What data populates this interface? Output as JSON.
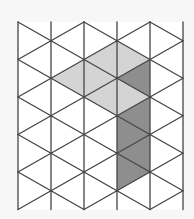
{
  "diagram": {
    "type": "triangular-isometric-grid",
    "columns_x": [
      18,
      51,
      84,
      117,
      150,
      183
    ],
    "even_col_nodes_y": [
      22,
      59.5,
      97,
      134.5,
      172,
      209.5
    ],
    "odd_col_nodes_y": [
      40.75,
      78.25,
      115.75,
      153.25,
      190.75
    ],
    "top_y": 22,
    "bottom_y": 209.5,
    "colors": {
      "background": "#f7f7f7",
      "line": "#454545",
      "light_fill": "#d4d4d4",
      "dark_fill": "#8e8e8e",
      "empty_fill": "#ffffff"
    },
    "shaded_triangles": [
      {
        "shade": "light",
        "points": [
          [
            84,
            59.5
          ],
          [
            117,
            40.75
          ],
          [
            117,
            78.25
          ]
        ]
      },
      {
        "shade": "light",
        "points": [
          [
            117,
            40.75
          ],
          [
            150,
            59.5
          ],
          [
            117,
            78.25
          ]
        ]
      },
      {
        "shade": "light",
        "points": [
          [
            51,
            78.25
          ],
          [
            84,
            59.5
          ],
          [
            84,
            97
          ]
        ]
      },
      {
        "shade": "light",
        "points": [
          [
            84,
            59.5
          ],
          [
            117,
            78.25
          ],
          [
            84,
            97
          ]
        ]
      },
      {
        "shade": "light",
        "points": [
          [
            84,
            97
          ],
          [
            117,
            78.25
          ],
          [
            117,
            115.75
          ]
        ]
      },
      {
        "shade": "light",
        "points": [
          [
            117,
            78.25
          ],
          [
            150,
            97
          ],
          [
            117,
            115.75
          ]
        ]
      },
      {
        "shade": "dark",
        "points": [
          [
            117,
            78.25
          ],
          [
            150,
            59.5
          ],
          [
            150,
            97
          ]
        ]
      },
      {
        "shade": "dark",
        "points": [
          [
            117,
            115.75
          ],
          [
            150,
            97
          ],
          [
            150,
            134.5
          ]
        ]
      },
      {
        "shade": "dark",
        "points": [
          [
            117,
            115.75
          ],
          [
            150,
            134.5
          ],
          [
            117,
            153.25
          ]
        ]
      },
      {
        "shade": "dark",
        "points": [
          [
            117,
            153.25
          ],
          [
            150,
            134.5
          ],
          [
            150,
            172
          ]
        ]
      },
      {
        "shade": "dark",
        "points": [
          [
            117,
            153.25
          ],
          [
            150,
            172
          ],
          [
            117,
            190.75
          ]
        ]
      }
    ]
  }
}
